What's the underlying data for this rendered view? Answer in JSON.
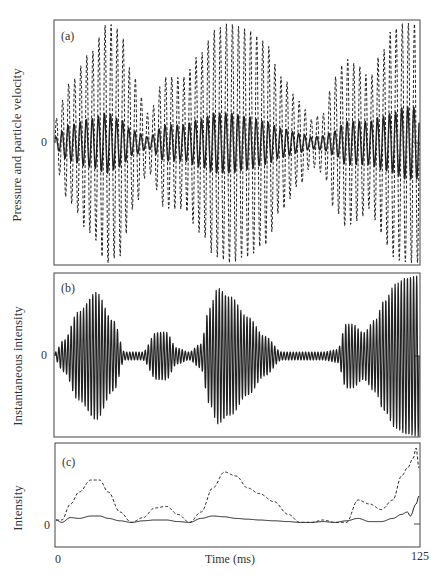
{
  "chart_data": [
    {
      "id": "a",
      "type": "line",
      "panel_label": "(a)",
      "ylabel": "Pressure and particle velocity",
      "zero_label": "0",
      "x_range": [
        0,
        125
      ],
      "cycles": 60,
      "series": [
        {
          "name": "pressure",
          "style": "dashed",
          "envelope_x": [
            0,
            5,
            12,
            18,
            22,
            27,
            32,
            38,
            44,
            50,
            55,
            60,
            66,
            72,
            78,
            84,
            88,
            92,
            96,
            100,
            104,
            108,
            112,
            116,
            120,
            125
          ],
          "envelope": [
            0.2,
            0.5,
            0.75,
            1.0,
            0.95,
            0.55,
            0.25,
            0.55,
            0.55,
            0.75,
            0.95,
            1.0,
            0.95,
            0.85,
            0.55,
            0.35,
            0.2,
            0.25,
            0.55,
            0.7,
            0.65,
            0.55,
            0.75,
            0.95,
            1.0,
            1.0
          ]
        },
        {
          "name": "particle velocity",
          "style": "solid",
          "envelope_x": [
            0,
            5,
            12,
            18,
            22,
            27,
            32,
            38,
            44,
            50,
            55,
            60,
            66,
            72,
            78,
            84,
            88,
            92,
            96,
            100,
            104,
            108,
            112,
            116,
            120,
            125
          ],
          "envelope": [
            0.05,
            0.15,
            0.2,
            0.25,
            0.2,
            0.1,
            0.05,
            0.15,
            0.15,
            0.2,
            0.25,
            0.25,
            0.22,
            0.18,
            0.12,
            0.08,
            0.05,
            0.06,
            0.1,
            0.18,
            0.18,
            0.18,
            0.22,
            0.25,
            0.3,
            0.3
          ]
        }
      ]
    },
    {
      "id": "b",
      "type": "line",
      "panel_label": "(b)",
      "ylabel": "Instantaneous intensity",
      "zero_label": "0",
      "x_range": [
        0,
        125
      ],
      "cycles": 118,
      "series": [
        {
          "name": "instantaneous intensity",
          "style": "solid",
          "envelope_x": [
            0,
            3,
            8,
            14,
            20,
            24,
            30,
            35,
            38,
            42,
            46,
            50,
            53,
            56,
            60,
            66,
            72,
            78,
            82,
            87,
            92,
            97,
            100,
            102,
            106,
            110,
            113,
            117,
            121,
            125
          ],
          "envelope": [
            0.05,
            0.2,
            0.55,
            0.8,
            0.45,
            0.05,
            0.05,
            0.3,
            0.3,
            0.1,
            0.05,
            0.15,
            0.6,
            0.85,
            0.75,
            0.5,
            0.25,
            0.05,
            0.05,
            0.05,
            0.05,
            0.08,
            0.4,
            0.4,
            0.3,
            0.45,
            0.7,
            0.9,
            1.0,
            1.0
          ]
        }
      ]
    },
    {
      "id": "c",
      "type": "line",
      "panel_label": "(c)",
      "ylabel": "Intensity",
      "zero_label": "0",
      "xlabel": "Time (ms)",
      "x_ticks": [
        "0",
        "125"
      ],
      "x_range": [
        0,
        125
      ],
      "series": [
        {
          "name": "intensity (dashed)",
          "style": "dashed",
          "x": [
            0,
            2,
            5,
            8,
            12,
            15,
            18,
            22,
            26,
            30,
            34,
            38,
            42,
            46,
            50,
            54,
            58,
            62,
            66,
            70,
            75,
            80,
            84,
            88,
            92,
            96,
            100,
            104,
            108,
            112,
            116,
            119,
            121,
            123,
            124,
            125
          ],
          "y": [
            0.05,
            0.05,
            0.25,
            0.4,
            0.55,
            0.55,
            0.4,
            0.15,
            0.02,
            0.08,
            0.2,
            0.22,
            0.12,
            0.02,
            0.15,
            0.45,
            0.65,
            0.6,
            0.45,
            0.38,
            0.28,
            0.12,
            0.02,
            0.02,
            0.05,
            0.02,
            0.02,
            0.3,
            0.25,
            0.18,
            0.3,
            0.6,
            0.7,
            0.82,
            0.95,
            0.7
          ]
        },
        {
          "name": "intensity (solid)",
          "style": "solid",
          "x": [
            0,
            2,
            5,
            8,
            12,
            15,
            18,
            22,
            26,
            30,
            34,
            38,
            42,
            46,
            50,
            54,
            58,
            62,
            66,
            70,
            75,
            80,
            84,
            88,
            92,
            96,
            100,
            104,
            108,
            112,
            116,
            119,
            121,
            122,
            124,
            125
          ],
          "y": [
            0.05,
            0.02,
            0.08,
            0.07,
            0.1,
            0.1,
            0.07,
            0.04,
            0.02,
            0.04,
            0.05,
            0.05,
            0.03,
            0.02,
            0.07,
            0.1,
            0.09,
            0.07,
            0.06,
            0.05,
            0.04,
            0.03,
            0.02,
            0.02,
            0.03,
            0.02,
            0.04,
            0.07,
            0.03,
            0.03,
            0.07,
            0.12,
            0.15,
            0.1,
            0.25,
            0.35
          ]
        }
      ]
    }
  ]
}
